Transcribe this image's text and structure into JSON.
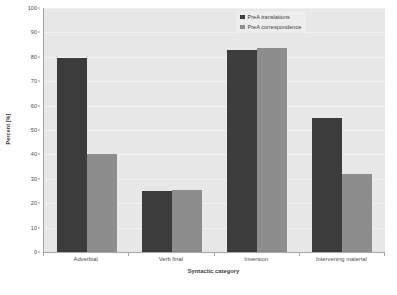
{
  "chart_data": {
    "type": "bar",
    "title": "",
    "xlabel": "Syntactic category",
    "ylabel": "Percent [%]",
    "categories": [
      "Adverbial",
      "Verb final",
      "Inversion",
      "Intervening material"
    ],
    "series": [
      {
        "name": "PreA translations",
        "color": "#3c3c3c",
        "values": [
          79.5,
          25.0,
          82.7,
          54.8
        ]
      },
      {
        "name": "PreA correspondence",
        "color": "#8d8d8d",
        "values": [
          40.0,
          25.3,
          83.6,
          32.0
        ]
      }
    ],
    "ylim": [
      0,
      100
    ],
    "ytick_values": [
      0,
      10,
      20,
      30,
      40,
      50,
      60,
      70,
      80,
      90,
      100
    ],
    "ytick_labels": [
      "0",
      "10",
      "20",
      "30",
      "40",
      "50",
      "60",
      "70",
      "80",
      "90",
      "100"
    ],
    "grid": true,
    "legend_position": "top-right",
    "plot_background": "#e7e7e7",
    "figure_background": "#ffffff"
  }
}
